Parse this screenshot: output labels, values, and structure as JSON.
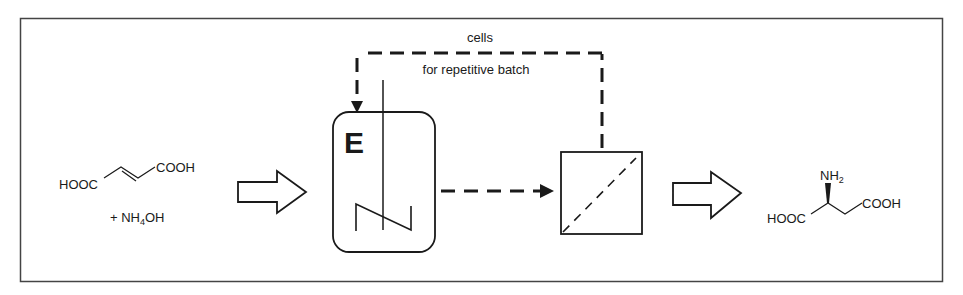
{
  "diagram": {
    "colors": {
      "stroke": "#1a1a1a",
      "frame": "#444444",
      "background": "#ffffff"
    },
    "reactants": {
      "fumaric_left": "HOOC",
      "fumaric_right": "COOH",
      "ammonia_prefix": "+ NH",
      "ammonia_sub": "4",
      "ammonia_suffix": "OH"
    },
    "reactor": {
      "enzyme_label": "E"
    },
    "recycle": {
      "top_label": "cells",
      "bottom_label": "for repetitive batch"
    },
    "product": {
      "left_group": "HOOC",
      "right_group": "COOH",
      "amine": "NH",
      "amine_sub": "2"
    },
    "icons": {
      "feed_arrow": "hollow-block-arrow-right",
      "reactor": "stirred-tank-reactor",
      "separator": "membrane-filter",
      "output_arrow": "hollow-block-arrow-right"
    }
  }
}
